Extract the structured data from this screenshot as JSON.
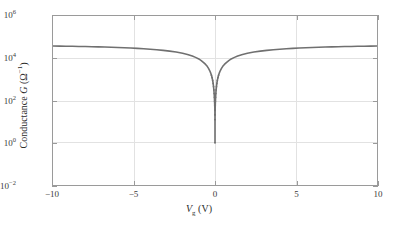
{
  "chart_data": {
    "type": "line",
    "title": "",
    "xlabel": "Vg (V)",
    "ylabel": "Conductance G (Ω⁻¹)",
    "xlim": [
      -10,
      10
    ],
    "ylim_log10": [
      -2,
      6
    ],
    "yscale": "log",
    "xscale": "linear",
    "grid": true,
    "legend": null,
    "xticks": [
      -10,
      -5,
      0,
      5,
      10
    ],
    "xticklabels": [
      "−10",
      "−5",
      "0",
      "5",
      "10"
    ],
    "yticks_log10": [
      -2,
      0,
      2,
      4,
      6
    ],
    "yticklabels": [
      "10−2",
      "10⁰",
      "10²",
      "10⁴",
      "10⁶"
    ],
    "series": [
      {
        "name": "Conductance",
        "color": "#707070",
        "marker": "dot",
        "x": [
          -10.0,
          -9.6,
          -9.2,
          -8.8,
          -8.4,
          -8.0,
          -7.6,
          -7.2,
          -6.8,
          -6.4,
          -6.0,
          -5.6,
          -5.2,
          -4.8,
          -4.4,
          -4.0,
          -3.6,
          -3.2,
          -2.8,
          -2.4,
          -2.0,
          -1.7,
          -1.4,
          -1.2,
          -1.0,
          -0.85,
          -0.7,
          -0.58,
          -0.48,
          -0.4,
          -0.33,
          -0.27,
          -0.22,
          -0.18,
          -0.145,
          -0.115,
          -0.09,
          -0.07,
          -0.052,
          -0.038,
          -0.026,
          -0.016,
          -0.009,
          -0.004,
          -0.0015,
          0.0,
          0.0015,
          0.004,
          0.009,
          0.016,
          0.026,
          0.038,
          0.052,
          0.07,
          0.09,
          0.115,
          0.145,
          0.18,
          0.22,
          0.27,
          0.33,
          0.4,
          0.48,
          0.58,
          0.7,
          0.85,
          1.0,
          1.2,
          1.4,
          1.7,
          2.0,
          2.4,
          2.8,
          3.2,
          3.6,
          4.0,
          4.4,
          4.8,
          5.2,
          5.6,
          6.0,
          6.4,
          6.8,
          7.2,
          7.6,
          8.0,
          8.4,
          8.8,
          9.2,
          9.6,
          10.0
        ],
        "y_log10": [
          4.58,
          4.575,
          4.57,
          4.565,
          4.56,
          4.553,
          4.546,
          4.538,
          4.529,
          4.519,
          4.508,
          4.496,
          4.482,
          4.466,
          4.448,
          4.427,
          4.403,
          4.374,
          4.338,
          4.293,
          4.234,
          4.176,
          4.104,
          4.042,
          3.968,
          3.89,
          3.796,
          3.708,
          3.617,
          3.52,
          3.42,
          3.31,
          3.2,
          3.08,
          2.95,
          2.81,
          2.66,
          2.5,
          2.33,
          2.15,
          1.96,
          1.76,
          1.55,
          1.33,
          1.1,
          0.0,
          1.1,
          1.33,
          1.55,
          1.76,
          1.96,
          2.15,
          2.33,
          2.5,
          2.66,
          2.81,
          2.95,
          3.08,
          3.2,
          3.31,
          3.42,
          3.52,
          3.617,
          3.708,
          3.796,
          3.89,
          3.968,
          4.042,
          4.104,
          4.176,
          4.234,
          4.293,
          4.338,
          4.374,
          4.403,
          4.427,
          4.448,
          4.466,
          4.482,
          4.496,
          4.508,
          4.519,
          4.529,
          4.538,
          4.546,
          4.553,
          4.56,
          4.565,
          4.57,
          4.575,
          4.58
        ],
        "notes": "Ambipolar transfer curve; sharp V-shaped minimum at Vg = 0 where conductance falls to about 1 ohm^-1; plateaus near 4e4 ohm^-1 at Vg = +/-10 V. Near the minimum the trace resolves into discrete scattered data points."
      }
    ],
    "style": {
      "grid_color": "#e2e2e2",
      "axis_color": "#9a9a9a",
      "tick_label_color": "#3a3a3a",
      "background": "#ffffff"
    }
  }
}
